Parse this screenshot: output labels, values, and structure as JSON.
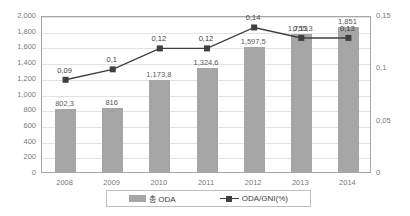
{
  "chart_data": {
    "type": "bar",
    "title": "",
    "subtitle": "",
    "xlabel": "",
    "ylabel": "",
    "categories": [
      "2008",
      "2009",
      "2010",
      "2011",
      "2012",
      "2013",
      "2014"
    ],
    "grid": true,
    "legend_position": "bottom",
    "axes": {
      "left": {
        "ylim": [
          0,
          2000
        ],
        "ticks": [
          "0",
          "200",
          "400",
          "600",
          "800",
          "1,000",
          "1,200",
          "1,400",
          "1,600",
          "1,800",
          "2,000"
        ],
        "tick_values": [
          0,
          200,
          400,
          600,
          800,
          1000,
          1200,
          1400,
          1600,
          1800,
          2000
        ]
      },
      "right": {
        "ylim": [
          0,
          0.15
        ],
        "ticks": [
          "0",
          "0,05",
          "0,1",
          "0,15"
        ],
        "tick_values": [
          0,
          0.05,
          0.1,
          0.15
        ]
      }
    },
    "series": [
      {
        "name": "총 ODA",
        "type": "bar",
        "axis": "left",
        "color": "#a6a6a6",
        "values": [
          802.3,
          816,
          1173.8,
          1324.6,
          1597.5,
          1755.3,
          1851
        ],
        "labels": [
          "802,3",
          "816",
          "1,173,8",
          "1,324,6",
          "1,597,5",
          "1,755,3",
          "1,851"
        ]
      },
      {
        "name": "ODA/GNI(%)",
        "type": "line",
        "axis": "right",
        "color": "#404040",
        "marker": "square",
        "values": [
          0.09,
          0.1,
          0.12,
          0.12,
          0.14,
          0.13,
          0.13
        ],
        "labels": [
          "0,09",
          "0,1",
          "0,12",
          "0,12",
          "0,14",
          "0,13",
          "0,13"
        ]
      }
    ]
  },
  "legend": {
    "items": [
      {
        "label": "총 ODA",
        "marker": "bar-swatch"
      },
      {
        "label": "ODA/GNI(%)",
        "marker": "line-marker-swatch"
      }
    ]
  }
}
